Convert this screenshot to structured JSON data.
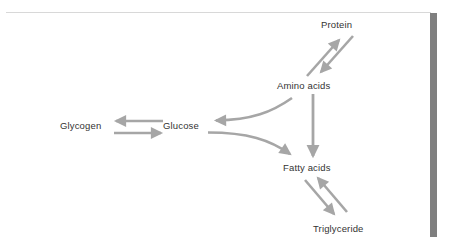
{
  "figure": {
    "type": "metabolic-pathway-diagram",
    "title": "",
    "background_color": "#ffffff",
    "arrow_color": "#a6a6a6",
    "label_color": "#333333",
    "rule_color": "#d8d8d8",
    "sidebar_color": "#7f7f7f"
  },
  "nodes": [
    {
      "id": "protein",
      "label": "Protein",
      "x": 348,
      "y": 25
    },
    {
      "id": "amino_acids",
      "label": "Amino acids",
      "x": 310,
      "y": 86
    },
    {
      "id": "glycogen",
      "label": "Glycogen",
      "x": 84,
      "y": 126
    },
    {
      "id": "glucose",
      "label": "Glucose",
      "x": 182,
      "y": 126
    },
    {
      "id": "fatty_acids",
      "label": "Fatty acids",
      "x": 312,
      "y": 168
    },
    {
      "id": "triglyceride",
      "label": "Triglyceride",
      "x": 344,
      "y": 229
    }
  ],
  "edges": [
    {
      "id": "amino-to-protein",
      "from": "amino_acids",
      "to": "protein",
      "direction": "one-way",
      "style": "diagonal"
    },
    {
      "id": "protein-to-amino",
      "from": "protein",
      "to": "amino_acids",
      "direction": "one-way",
      "style": "diagonal"
    },
    {
      "id": "amino-to-fatty",
      "from": "amino_acids",
      "to": "fatty_acids",
      "direction": "one-way",
      "style": "vertical"
    },
    {
      "id": "glucose-to-glycogen",
      "from": "glucose",
      "to": "glycogen",
      "direction": "one-way",
      "style": "horizontal"
    },
    {
      "id": "glycogen-to-glucose",
      "from": "glycogen",
      "to": "glucose",
      "direction": "one-way",
      "style": "horizontal"
    },
    {
      "id": "amino-to-glucose",
      "from": "amino_acids",
      "to": "glucose",
      "direction": "one-way",
      "style": "curved-fork"
    },
    {
      "id": "glucose-to-fatty",
      "from": "glucose",
      "to": "fatty_acids",
      "direction": "one-way",
      "style": "curved-fork"
    },
    {
      "id": "triglyceride-to-fatty",
      "from": "triglyceride",
      "to": "fatty_acids",
      "direction": "one-way",
      "style": "diagonal"
    },
    {
      "id": "fatty-to-triglyceride",
      "from": "fatty_acids",
      "to": "triglyceride",
      "direction": "one-way",
      "style": "diagonal"
    }
  ]
}
